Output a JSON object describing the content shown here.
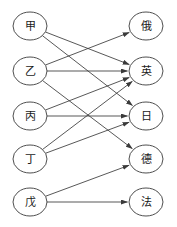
{
  "diagram": {
    "type": "bipartite-directed-graph",
    "title": "",
    "left_column": {
      "name": "source-nodes",
      "nodes": [
        {
          "id": "jia",
          "label": "甲",
          "cx": 30,
          "cy": 26
        },
        {
          "id": "yi",
          "label": "乙",
          "cx": 30,
          "cy": 71
        },
        {
          "id": "bing",
          "label": "丙",
          "cx": 30,
          "cy": 116
        },
        {
          "id": "ding",
          "label": "丁",
          "cx": 30,
          "cy": 159
        },
        {
          "id": "wu",
          "label": "戊",
          "cx": 30,
          "cy": 202
        }
      ]
    },
    "right_column": {
      "name": "target-nodes",
      "nodes": [
        {
          "id": "e",
          "label": "俄",
          "cx": 146,
          "cy": 26
        },
        {
          "id": "ying",
          "label": "英",
          "cx": 146,
          "cy": 71
        },
        {
          "id": "ri",
          "label": "日",
          "cx": 146,
          "cy": 116
        },
        {
          "id": "de",
          "label": "德",
          "cx": 146,
          "cy": 159
        },
        {
          "id": "fa",
          "label": "法",
          "cx": 146,
          "cy": 202
        }
      ]
    },
    "node_shape": {
      "rx": 17,
      "ry": 14
    },
    "edges": [
      {
        "from": "jia",
        "to": "ying"
      },
      {
        "from": "jia",
        "to": "ri"
      },
      {
        "from": "yi",
        "to": "e"
      },
      {
        "from": "yi",
        "to": "ying"
      },
      {
        "from": "yi",
        "to": "de"
      },
      {
        "from": "bing",
        "to": "ying"
      },
      {
        "from": "bing",
        "to": "ri"
      },
      {
        "from": "ding",
        "to": "ying"
      },
      {
        "from": "ding",
        "to": "ri"
      },
      {
        "from": "wu",
        "to": "de"
      },
      {
        "from": "wu",
        "to": "fa"
      }
    ],
    "colors": {
      "stroke": "#3a3a3a",
      "node_fill": "#ffffff",
      "label": "#1a1a1a",
      "background": "#ffffff"
    }
  }
}
